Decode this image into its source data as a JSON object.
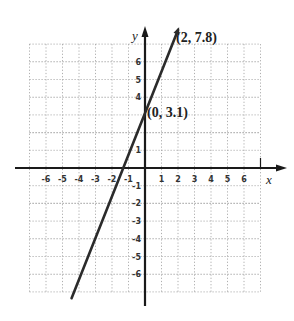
{
  "chart_data": {
    "type": "line",
    "title": "",
    "xlabel": "x",
    "ylabel": "y",
    "xlim": [
      -7,
      7
    ],
    "ylim": [
      -7,
      7
    ],
    "grid": true,
    "grid_style": "dotted",
    "x_ticks": [
      -6,
      -5,
      -4,
      -3,
      -2,
      -1,
      1,
      2,
      3,
      4,
      5,
      6
    ],
    "y_ticks": [
      6,
      5,
      4,
      1,
      -1,
      -2,
      -3,
      -4,
      -5,
      -6
    ],
    "x_tick_labels": [
      "-6",
      "-5",
      "-4",
      "-3",
      "-2",
      "-1",
      "1",
      "2",
      "3",
      "4",
      "5",
      "6"
    ],
    "y_tick_labels": [
      "6",
      "5",
      "4",
      "1",
      "-1",
      "-2",
      "-3",
      "-4",
      "-5",
      "-6"
    ],
    "series": [
      {
        "name": "line",
        "equation": "y = 2.35x + 3.1",
        "slope": 2.35,
        "intercept": 3.1,
        "points": [
          {
            "x": 0,
            "y": 3.1,
            "label": "(0, 3.1)"
          },
          {
            "x": 2,
            "y": 7.8,
            "label": "(2, 7.8)"
          }
        ],
        "x_range": [
          -4.45,
          2
        ]
      }
    ],
    "annotations": [
      "(2, 7.8)",
      "(0, 3.1)"
    ],
    "colors": {
      "line": "#2b2b2b",
      "axis": "#1a1a1a",
      "grid": "#9a9a9a"
    }
  }
}
